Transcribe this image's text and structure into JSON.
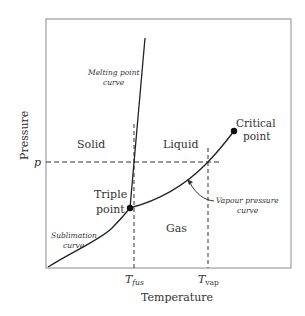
{
  "diagram": {
    "type": "phase-diagram",
    "axes": {
      "xlabel": "Temperature",
      "ylabel": "Pressure",
      "x_ticks": [
        {
          "base": "T",
          "sub": "fus"
        },
        {
          "base": "T",
          "sub": "vap"
        }
      ],
      "y_ticks": [
        {
          "label": "p"
        }
      ]
    },
    "regions": {
      "solid": "Solid",
      "liquid": "Liquid",
      "gas": "Gas"
    },
    "points": {
      "triple": {
        "line1": "Triple",
        "line2": "point"
      },
      "critical": {
        "line1": "Critical",
        "line2": "point"
      }
    },
    "curves": {
      "melting": {
        "line1": "Melting point",
        "line2": "curve"
      },
      "sublimation": {
        "line1": "Sublimation",
        "line2": "curve"
      },
      "vapour": {
        "line1": "Vapour pressure",
        "line2": "curve"
      }
    },
    "colors": {
      "frame": "#8a8a8a",
      "curve": "#222222",
      "dashed": "#333333",
      "text": "#333333"
    }
  }
}
